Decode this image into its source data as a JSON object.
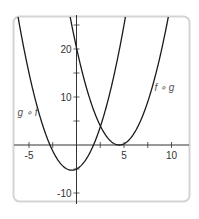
{
  "chart_data": {
    "type": "line",
    "title": "",
    "xlabel": "",
    "ylabel": "",
    "xlim": [
      -6.5,
      11.9
    ],
    "ylim": [
      -11.8,
      26.7
    ],
    "grid": false,
    "x_ticks": [
      -5,
      -2.5,
      2.5,
      5,
      7.5,
      10
    ],
    "x_tick_labels": [
      {
        "value": -5,
        "label": "-5"
      },
      {
        "value": 5,
        "label": "5"
      },
      {
        "value": 10,
        "label": "10"
      }
    ],
    "y_ticks": [
      -10,
      -5,
      5,
      10,
      15,
      20,
      25
    ],
    "y_tick_labels": [
      {
        "value": 20,
        "label": "20"
      },
      {
        "value": 10,
        "label": "10"
      },
      {
        "value": -10,
        "label": "-10"
      }
    ],
    "series": [
      {
        "name": "g ∘ f",
        "expression": "x^2 + x - 5",
        "coeffs": [
          1,
          1,
          -5
        ],
        "label_pos": {
          "x": -6.2,
          "y": 6
        },
        "x": [
          -6,
          -5,
          -4,
          -3,
          -2,
          -1,
          -0.5,
          0,
          1,
          2,
          3,
          4,
          5
        ],
        "y": [
          25,
          15,
          7,
          1,
          -3,
          -5,
          -5.25,
          -5,
          -3,
          1,
          7,
          15,
          25
        ]
      },
      {
        "name": "f ∘ g",
        "expression": "(x - 4.5)^2",
        "coeffs": [
          1,
          -9,
          20.25
        ],
        "label_pos": {
          "x": 8.2,
          "y": 11.3
        },
        "x": [
          -0.5,
          0,
          1,
          2,
          3,
          4,
          4.5,
          5,
          6,
          7,
          8,
          9,
          9.5
        ],
        "y": [
          25,
          20.25,
          12.25,
          6.25,
          2.25,
          0.25,
          0,
          0.25,
          2.25,
          6.25,
          12.25,
          20.25,
          25
        ]
      }
    ],
    "colors": {
      "curve": "#1a1a1a",
      "axis": "#333333",
      "frame": "#d4d4d4",
      "label": "#555555"
    }
  }
}
